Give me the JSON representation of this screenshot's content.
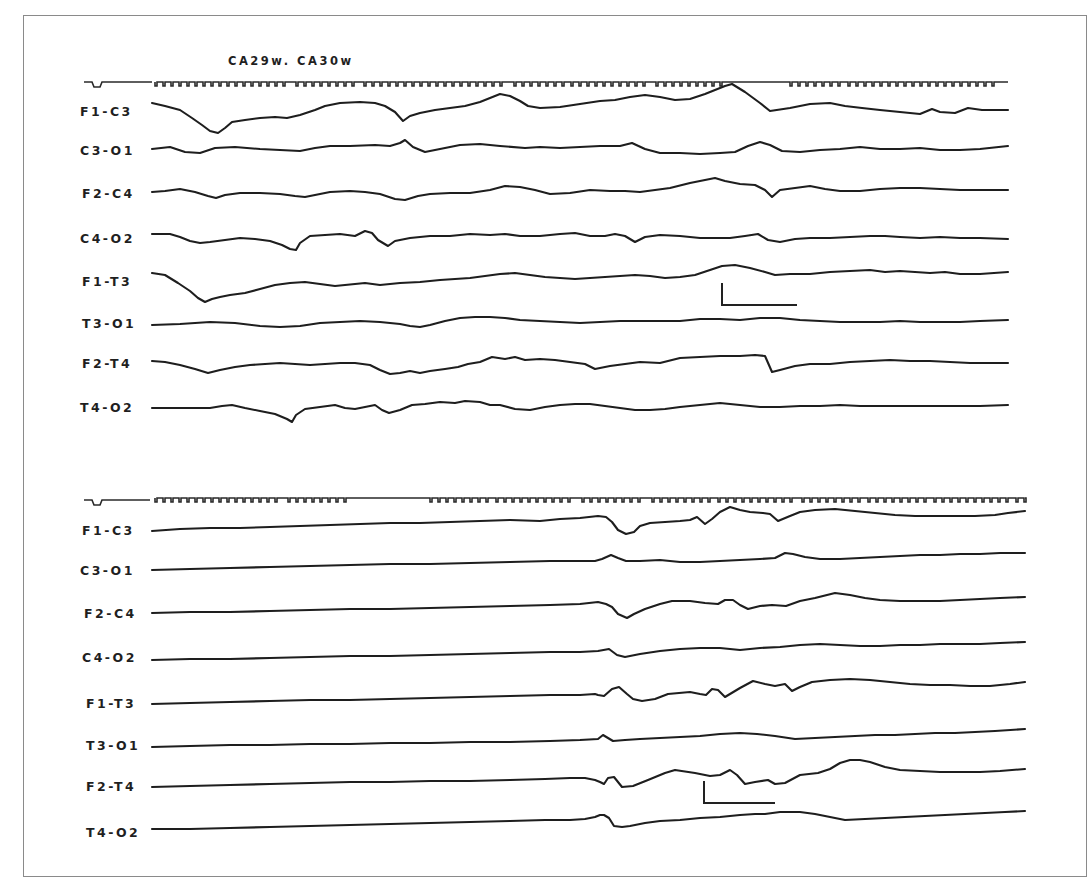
{
  "figure": {
    "title": "CA29w. CA30w",
    "background": "#ffffff",
    "ink_color": "#1e1e1e",
    "frame_color": "#8a8a8a"
  },
  "panels": [
    {
      "id": "top",
      "channels": [
        {
          "label": "F1-C3"
        },
        {
          "label": "C3-O1"
        },
        {
          "label": "F2-C4"
        },
        {
          "label": "C4-O2"
        },
        {
          "label": "F1-T3"
        },
        {
          "label": "T3-O1"
        },
        {
          "label": "F2-T4"
        },
        {
          "label": "T4-O2"
        }
      ],
      "calibration_bar": {
        "x": 722,
        "y_top": 283,
        "y_bottom": 305,
        "x_end": 797
      }
    },
    {
      "id": "bottom",
      "channels": [
        {
          "label": "F1-C3"
        },
        {
          "label": "C3-O1"
        },
        {
          "label": "F2-C4"
        },
        {
          "label": "C4-O2"
        },
        {
          "label": "F1-T3"
        },
        {
          "label": "T3-O1"
        },
        {
          "label": "F2-T4"
        },
        {
          "label": "T4-O2"
        }
      ],
      "calibration_bar": {
        "x": 704,
        "y_top": 781,
        "y_bottom": 803,
        "x_end": 775
      }
    }
  ]
}
